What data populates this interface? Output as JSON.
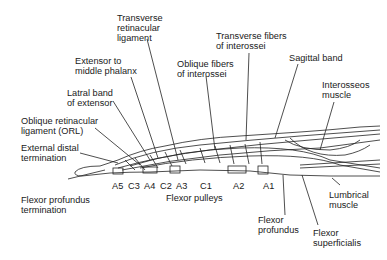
{
  "diagram": {
    "type": "anatomical-illustration",
    "labels": {
      "transverse_retinacular": "Transverse\nretinacular\nligament",
      "extensor_middle": "Extensor to\nmiddle phalanx",
      "lateral_band": "Latral band\nof extensor",
      "orl": "Oblique retinacular\nligament (ORL)",
      "external_distal": "External distal\ntermination",
      "flexor_prof_term": "Flexor profundus\ntermination",
      "oblique_fibers": "Oblique fibers\nof interossei",
      "transverse_fibers": "Transverse fibers\nof interossei",
      "sagittal_band": "Sagittal band",
      "interosseos": "Interosseos\nmuscle",
      "lumbrical": "Lumbrical\nmuscle",
      "flexor_profundus": "Flexor\nprofundus",
      "flexor_superficialis": "Flexor\nsuperficialis",
      "flexor_pulleys": "Flexor pulleys"
    },
    "pulleys": [
      "A5",
      "C3",
      "A4",
      "C2",
      "A3",
      "C1",
      "A2",
      "A1"
    ]
  }
}
